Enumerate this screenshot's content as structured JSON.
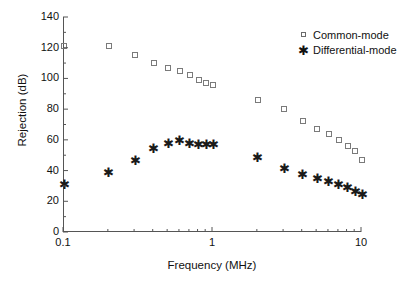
{
  "chart_data": {
    "type": "scatter",
    "title": "",
    "xlabel": "Frequency (MHz)",
    "ylabel": "Rejection (dB)",
    "xscale": "log",
    "yscale": "linear",
    "xlim": [
      0.1,
      10
    ],
    "ylim": [
      0,
      140
    ],
    "xticks": [
      0.1,
      1,
      10
    ],
    "xtick_labels": [
      "0.1",
      "1",
      "10"
    ],
    "yticks": [
      0,
      20,
      40,
      60,
      80,
      100,
      120,
      140
    ],
    "ytick_labels": [
      "0",
      "20",
      "40",
      "60",
      "80",
      "100",
      "120",
      "140"
    ],
    "grid": false,
    "legend_position": "top-right inside",
    "series": [
      {
        "name": "Common-mode",
        "marker": "open-square",
        "color": "#7a7a7a",
        "points": [
          [
            0.1,
            121
          ],
          [
            0.2,
            121
          ],
          [
            0.3,
            115
          ],
          [
            0.4,
            110
          ],
          [
            0.5,
            107
          ],
          [
            0.6,
            105
          ],
          [
            0.7,
            102
          ],
          [
            0.8,
            99
          ],
          [
            0.9,
            97
          ],
          [
            1.0,
            96
          ],
          [
            2.0,
            86
          ],
          [
            3.0,
            80
          ],
          [
            4.0,
            72
          ],
          [
            5.0,
            67
          ],
          [
            6.0,
            64
          ],
          [
            7.0,
            60
          ],
          [
            8.0,
            56
          ],
          [
            9.0,
            53
          ],
          [
            10.0,
            47
          ]
        ]
      },
      {
        "name": "Differential-mode",
        "marker": "star",
        "color": "#1a1a1a",
        "points": [
          [
            0.1,
            31
          ],
          [
            0.2,
            39
          ],
          [
            0.3,
            47
          ],
          [
            0.4,
            55
          ],
          [
            0.5,
            58
          ],
          [
            0.6,
            60
          ],
          [
            0.7,
            58
          ],
          [
            0.8,
            57
          ],
          [
            0.9,
            57
          ],
          [
            1.0,
            57
          ],
          [
            2.0,
            49
          ],
          [
            3.0,
            42
          ],
          [
            4.0,
            38
          ],
          [
            5.0,
            35
          ],
          [
            6.0,
            33
          ],
          [
            7.0,
            31
          ],
          [
            8.0,
            29
          ],
          [
            9.0,
            27
          ],
          [
            10.0,
            25
          ]
        ]
      }
    ]
  },
  "legend": {
    "items": [
      {
        "label": "Common-mode",
        "marker": "open-square"
      },
      {
        "label": "Differential-mode",
        "marker": "star"
      }
    ]
  },
  "axes": {
    "x_title": "Frequency (MHz)",
    "y_title": "Rejection (dB)"
  }
}
